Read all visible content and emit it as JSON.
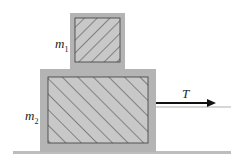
{
  "diagram": {
    "type": "physics-free-body",
    "blocks": [
      {
        "id": "m1",
        "label_base": "m",
        "label_sub": "1",
        "position": "top"
      },
      {
        "id": "m2",
        "label_base": "m",
        "label_sub": "2",
        "position": "bottom"
      }
    ],
    "force": {
      "label": "T",
      "direction": "right",
      "applied_to": "m2"
    },
    "surface": "horizontal ground",
    "colors": {
      "frame": "#b4b4b4",
      "fill": "#c8c8c8",
      "hatch": "#3a3a3a",
      "ground": "#bdbdbd",
      "arrow": "#111111"
    }
  }
}
